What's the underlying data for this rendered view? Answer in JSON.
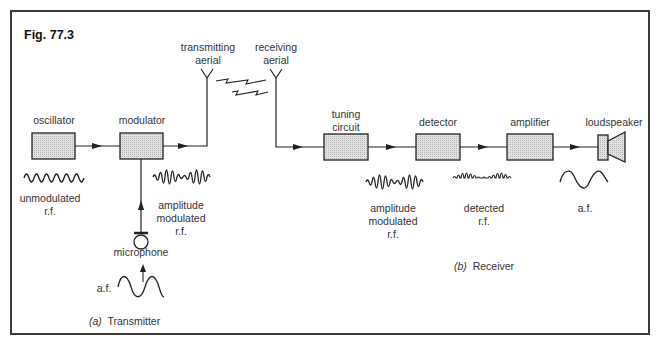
{
  "figure": {
    "title": "Fig. 77.3"
  },
  "transmitter": {
    "caption_letter": "(a)",
    "caption_text": "Transmitter",
    "blocks": [
      {
        "id": "oscillator",
        "label": "oscillator"
      },
      {
        "id": "modulator",
        "label": "modulator"
      }
    ],
    "aerial_label_line1": "transmitting",
    "aerial_label_line2": "aerial",
    "input_device": "microphone",
    "waveforms": [
      {
        "id": "unmodulated-rf",
        "line1": "unmodulated",
        "line2": "r.f."
      },
      {
        "id": "am-rf",
        "line1": "amplitude",
        "line2": "modulated",
        "line3": "r.f."
      },
      {
        "id": "af-in",
        "line1": "a.f."
      }
    ]
  },
  "receiver": {
    "caption_letter": "(b)",
    "caption_text": "Receiver",
    "aerial_label_line1": "receiving",
    "aerial_label_line2": "aerial",
    "blocks": [
      {
        "id": "tuning-circuit",
        "line1": "tuning",
        "line2": "circuit"
      },
      {
        "id": "detector",
        "label": "detector"
      },
      {
        "id": "amplifier",
        "label": "amplifier"
      },
      {
        "id": "loudspeaker",
        "label": "loudspeaker"
      }
    ],
    "waveforms": [
      {
        "id": "am-rf",
        "line1": "amplitude",
        "line2": "modulated",
        "line3": "r.f."
      },
      {
        "id": "detected-rf",
        "line1": "detected",
        "line2": "r.f."
      },
      {
        "id": "af-out",
        "line1": "a.f."
      }
    ]
  },
  "colors": {
    "line": "#2a2a2a",
    "block_fill": "#d4d4d4",
    "frame": "#3a3a3a"
  }
}
